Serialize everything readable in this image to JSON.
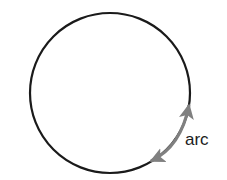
{
  "figure": {
    "background_color": "#ffffff",
    "width": 227,
    "height": 180,
    "circle": {
      "name": "circle",
      "stroke_color": "#1a1a1a",
      "stroke_width": 2,
      "fill": "none",
      "center_x": 110,
      "center_y": 93,
      "radius": 80
    },
    "arc_arrow": {
      "name": "arc-double-arrow",
      "color": "#808080",
      "stroke_width": 3,
      "double_headed": true,
      "start_x": 151,
      "start_y": 161,
      "end_x": 189,
      "end_y": 105,
      "control_x": 181,
      "control_y": 147
    },
    "label": {
      "text": "arc",
      "color": "#1c1c1c",
      "font_size": 17
    }
  }
}
